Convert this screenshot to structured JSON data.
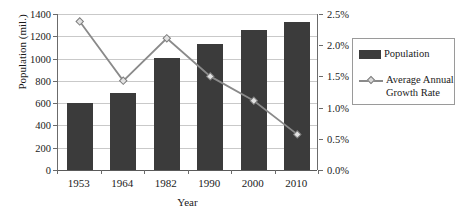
{
  "chart_data": {
    "type": "bar",
    "title": "",
    "categories": [
      "1953",
      "1964",
      "1982",
      "1990",
      "2000",
      "2010"
    ],
    "xlabel": "Year",
    "ylabel": "Population (mil.)",
    "ylabel_right": "",
    "ylim": [
      0,
      1400
    ],
    "ylim_right": [
      0,
      0.025
    ],
    "grid": true,
    "legend_position": "right",
    "series": [
      {
        "name": "Population",
        "type": "bar",
        "axis": "left",
        "color": "#3b3b3b",
        "values": [
          600,
          695,
          1008,
          1130,
          1258,
          1330
        ]
      },
      {
        "name": "Average Annual Growth Rate",
        "type": "line",
        "axis": "right",
        "color": "#8a8a8a",
        "values": [
          0.0238,
          0.0143,
          0.0211,
          0.015,
          0.0111,
          0.0057
        ],
        "value_labels": [
          "2.38%",
          "1.43%",
          "2.11%",
          "1.50%",
          "1.11%",
          "0.57%"
        ]
      }
    ],
    "yticks_left": [
      0,
      200,
      400,
      600,
      800,
      1000,
      1200,
      1400
    ],
    "ytick_labels_left": [
      "0",
      "200",
      "400",
      "600",
      "800",
      "1000",
      "1200",
      "1400"
    ],
    "yticks_right": [
      0.0,
      0.005,
      0.01,
      0.015,
      0.02,
      0.025
    ],
    "ytick_labels_right": [
      "0.0%",
      "0.5%",
      "1.0%",
      "1.5%",
      "2.0%",
      "2.5%"
    ]
  },
  "axes": {
    "y_left_title": "Population (mil.)",
    "x_title": "Year"
  },
  "legend": {
    "entries": [
      {
        "label": "Population",
        "marker": "bar-swatch-icon"
      },
      {
        "label": "Average Annual Growth Rate",
        "marker": "line-marker-icon"
      }
    ]
  }
}
